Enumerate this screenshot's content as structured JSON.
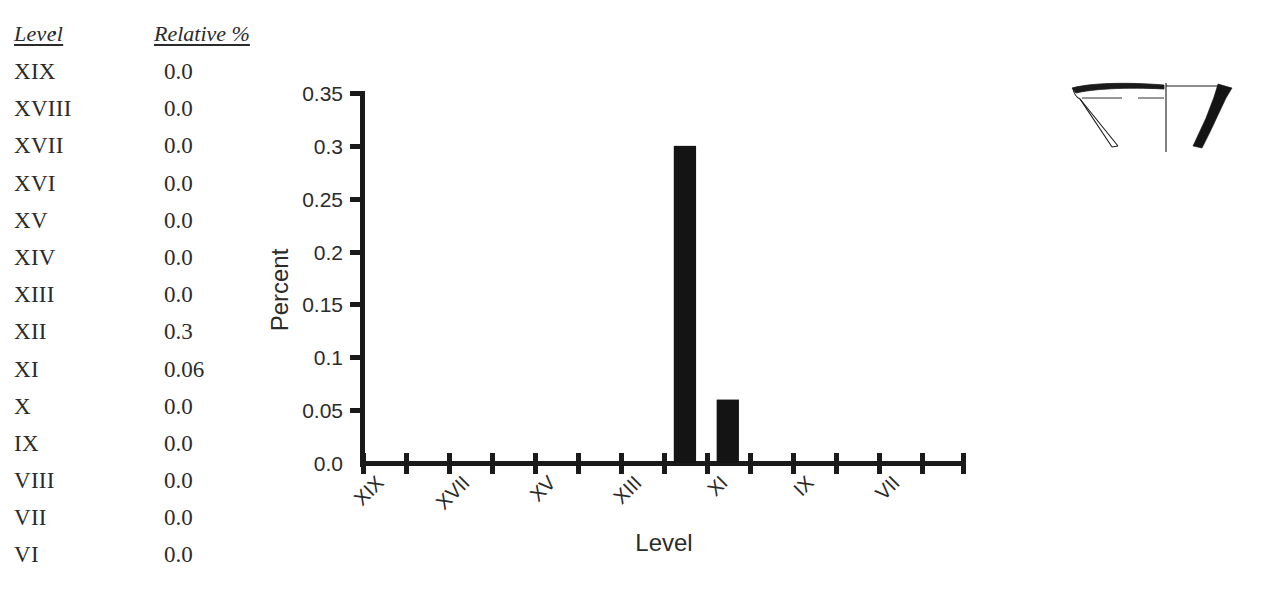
{
  "table": {
    "headers": {
      "level": "Level",
      "relative": "Relative %"
    },
    "rows": [
      {
        "level": "XIX",
        "relative": "0.0"
      },
      {
        "level": "XVIII",
        "relative": "0.0"
      },
      {
        "level": "XVII",
        "relative": "0.0"
      },
      {
        "level": "XVI",
        "relative": "0.0"
      },
      {
        "level": "XV",
        "relative": "0.0"
      },
      {
        "level": "XIV",
        "relative": "0.0"
      },
      {
        "level": "XIII",
        "relative": "0.0"
      },
      {
        "level": "XII",
        "relative": "0.3"
      },
      {
        "level": "XI",
        "relative": "0.06"
      },
      {
        "level": "X",
        "relative": "0.0"
      },
      {
        "level": "IX",
        "relative": "0.0"
      },
      {
        "level": "VIII",
        "relative": "0.0"
      },
      {
        "level": "VII",
        "relative": "0.0"
      },
      {
        "level": "VI",
        "relative": "0.0"
      }
    ]
  },
  "chart_data": {
    "type": "bar",
    "title": "",
    "xlabel": "Level",
    "ylabel": "Percent",
    "categories": [
      "XIX",
      "XVIII",
      "XVII",
      "XVI",
      "XV",
      "XIV",
      "XIII",
      "XII",
      "XI",
      "X",
      "IX",
      "VIII",
      "VII",
      "VI"
    ],
    "values": [
      0.0,
      0.0,
      0.0,
      0.0,
      0.0,
      0.0,
      0.0,
      0.3,
      0.06,
      0.0,
      0.0,
      0.0,
      0.0,
      0.0
    ],
    "ylim": [
      0.0,
      0.35
    ],
    "yticks": [
      "0.0",
      "0.05",
      "0.1",
      "0.15",
      "0.2",
      "0.25",
      "0.3",
      "0.35"
    ],
    "ytick_values": [
      0.0,
      0.05,
      0.1,
      0.15,
      0.2,
      0.25,
      0.3,
      0.35
    ],
    "xtick_labels_shown": [
      "XIX",
      "XVII",
      "XV",
      "XIII",
      "XI",
      "IX",
      "VII"
    ],
    "xtick_label_rotation": 45,
    "grid": false,
    "legend": "none",
    "bar_color": "#141414"
  },
  "figure": {
    "caption": "",
    "name": "ceramic-rim-profile-drawing"
  }
}
